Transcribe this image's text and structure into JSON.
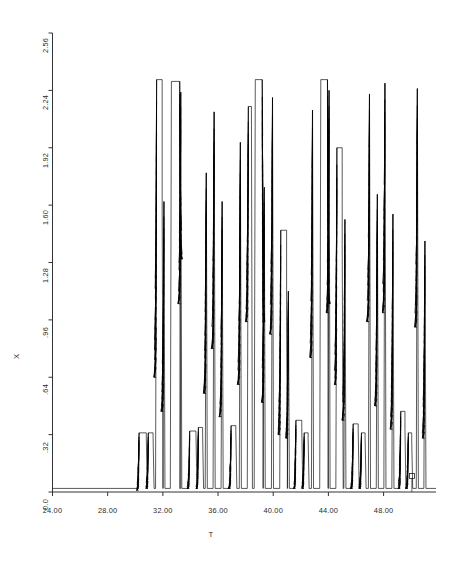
{
  "chart_data": {
    "type": "line",
    "title": "",
    "subtitle": "",
    "xlabel": "T",
    "ylabel": "X",
    "xlim": [
      24.0,
      51.8
    ],
    "ylim": [
      0.0,
      2.56
    ],
    "grid": false,
    "legend": null,
    "annotations": [
      {
        "label": "small-open-square-marker",
        "x": 50.05,
        "y": 0.09
      }
    ],
    "xticks": [
      24.0,
      28.0,
      32.0,
      36.0,
      40.0,
      44.0,
      48.0
    ],
    "xtick_labels": [
      "24.00",
      "28.00",
      "32.00",
      "36.00",
      "40.00",
      "44.00",
      "48.00"
    ],
    "yticks": [
      0.0,
      0.32,
      0.64,
      0.96,
      1.28,
      1.6,
      1.92,
      2.24,
      2.56
    ],
    "ytick_labels": [
      "0.0",
      ".32",
      ".64",
      ".96",
      "1.28",
      "1.60",
      "1.92",
      "2.24",
      "2.56"
    ],
    "series": [
      {
        "name": "X(T)",
        "color": "#000000",
        "description": "chaotic relaxation-oscillator burst train: flat quiescent segment until T=30.2, then irregular spikes with thin rising edges, dense dark descending oscillation brushes and flat plateau tops",
        "quiet_until": 30.2,
        "baseline": 0.02,
        "spikes": [
          {
            "t": 30.28,
            "peak": 0.33,
            "plateau": 0.3,
            "plateau_width": 0.52,
            "brush_bottom": 0.01,
            "brush_side": "left"
          },
          {
            "t": 30.95,
            "peak": 0.33,
            "plateau": 0.31,
            "plateau_width": 0.34,
            "brush_bottom": 0.02,
            "brush_side": "left"
          },
          {
            "t": 31.55,
            "peak": 2.3,
            "plateau": 1.56,
            "plateau_width": 0.4,
            "brush_bottom": 0.64,
            "brush_side": "left"
          },
          {
            "t": 32.08,
            "peak": 1.62,
            "plateau": null,
            "plateau_width": 0,
            "brush_bottom": 0.45,
            "brush_side": "left"
          },
          {
            "t": 32.62,
            "peak": 2.29,
            "plateau": 2.28,
            "plateau_width": 0.6,
            "brush_bottom": 1.3,
            "brush_side": "right"
          },
          {
            "t": 33.3,
            "peak": 2.23,
            "plateau": null,
            "plateau_width": 0,
            "brush_bottom": 1.05,
            "brush_side": "left"
          },
          {
            "t": 33.95,
            "peak": 0.34,
            "plateau": 0.32,
            "plateau_width": 0.45,
            "brush_bottom": 0.02,
            "brush_side": "left"
          },
          {
            "t": 34.58,
            "peak": 0.36,
            "plateau": 0.33,
            "plateau_width": 0.3,
            "brush_bottom": 0.02,
            "brush_side": "left"
          },
          {
            "t": 35.15,
            "peak": 1.78,
            "plateau": null,
            "plateau_width": 0,
            "brush_bottom": 0.55,
            "brush_side": "left"
          },
          {
            "t": 35.72,
            "peak": 2.12,
            "plateau": null,
            "plateau_width": 0,
            "brush_bottom": 0.8,
            "brush_side": "left"
          },
          {
            "t": 36.3,
            "peak": 1.62,
            "plateau": null,
            "plateau_width": 0,
            "brush_bottom": 0.42,
            "brush_side": "left"
          },
          {
            "t": 36.95,
            "peak": 0.37,
            "plateau": 0.34,
            "plateau_width": 0.34,
            "brush_bottom": 0.02,
            "brush_side": "left"
          },
          {
            "t": 37.62,
            "peak": 1.95,
            "plateau": null,
            "plateau_width": 0,
            "brush_bottom": 0.6,
            "brush_side": "left"
          },
          {
            "t": 38.2,
            "peak": 2.15,
            "plateau": 2.13,
            "plateau_width": 0.22,
            "brush_bottom": 0.95,
            "brush_side": "left"
          },
          {
            "t": 38.7,
            "peak": 2.3,
            "plateau": 2.27,
            "plateau_width": 0.5,
            "brush_bottom": 0.95,
            "brush_side": "right"
          },
          {
            "t": 39.35,
            "peak": 1.7,
            "plateau": null,
            "plateau_width": 0,
            "brush_bottom": 0.5,
            "brush_side": "left"
          },
          {
            "t": 39.95,
            "peak": 2.2,
            "plateau": null,
            "plateau_width": 0,
            "brush_bottom": 0.88,
            "brush_side": "left"
          },
          {
            "t": 40.55,
            "peak": 1.46,
            "plateau": 0.95,
            "plateau_width": 0.42,
            "brush_bottom": 0.32,
            "brush_side": "left"
          },
          {
            "t": 41.1,
            "peak": 1.12,
            "plateau": null,
            "plateau_width": 0,
            "brush_bottom": 0.3,
            "brush_side": "left"
          },
          {
            "t": 41.65,
            "peak": 0.4,
            "plateau": 0.36,
            "plateau_width": 0.42,
            "brush_bottom": 0.02,
            "brush_side": "left"
          },
          {
            "t": 42.25,
            "peak": 0.33,
            "plateau": 0.3,
            "plateau_width": 0.28,
            "brush_bottom": 0.02,
            "brush_side": "left"
          },
          {
            "t": 42.85,
            "peak": 2.13,
            "plateau": null,
            "plateau_width": 0,
            "brush_bottom": 0.75,
            "brush_side": "left"
          },
          {
            "t": 43.45,
            "peak": 2.3,
            "plateau": 2.27,
            "plateau_width": 0.48,
            "brush_bottom": 1.05,
            "brush_side": "right"
          },
          {
            "t": 44.05,
            "peak": 2.24,
            "plateau": null,
            "plateau_width": 0,
            "brush_bottom": 1.0,
            "brush_side": "left"
          },
          {
            "t": 44.62,
            "peak": 1.92,
            "plateau": 1.38,
            "plateau_width": 0.38,
            "brush_bottom": 0.6,
            "brush_side": "left"
          },
          {
            "t": 45.2,
            "peak": 1.52,
            "plateau": null,
            "plateau_width": 0,
            "brush_bottom": 0.4,
            "brush_side": "left"
          },
          {
            "t": 45.8,
            "peak": 0.38,
            "plateau": 0.34,
            "plateau_width": 0.36,
            "brush_bottom": 0.02,
            "brush_side": "left"
          },
          {
            "t": 46.4,
            "peak": 0.33,
            "plateau": 0.3,
            "plateau_width": 0.26,
            "brush_bottom": 0.02,
            "brush_side": "left"
          },
          {
            "t": 46.98,
            "peak": 2.22,
            "plateau": null,
            "plateau_width": 0,
            "brush_bottom": 0.95,
            "brush_side": "left"
          },
          {
            "t": 47.55,
            "peak": 1.66,
            "plateau": null,
            "plateau_width": 0,
            "brush_bottom": 0.48,
            "brush_side": "left"
          },
          {
            "t": 48.1,
            "peak": 2.28,
            "plateau": null,
            "plateau_width": 0,
            "brush_bottom": 1.0,
            "brush_side": "left"
          },
          {
            "t": 48.68,
            "peak": 1.55,
            "plateau": null,
            "plateau_width": 0,
            "brush_bottom": 0.35,
            "brush_side": "left"
          },
          {
            "t": 49.25,
            "peak": 0.45,
            "plateau": 0.35,
            "plateau_width": 0.3,
            "brush_bottom": 0.02,
            "brush_side": "left"
          },
          {
            "t": 49.8,
            "peak": 0.33,
            "plateau": 0.28,
            "plateau_width": 0.24,
            "brush_bottom": 0.02,
            "brush_side": "left"
          },
          {
            "t": 50.45,
            "peak": 2.25,
            "plateau": null,
            "plateau_width": 0,
            "brush_bottom": 0.92,
            "brush_side": "left"
          },
          {
            "t": 51.0,
            "peak": 1.4,
            "plateau": null,
            "plateau_width": 0,
            "brush_bottom": 0.3,
            "brush_side": "left"
          }
        ]
      }
    ]
  },
  "axes": {
    "line_color": "#333333",
    "tick_length": 4
  }
}
